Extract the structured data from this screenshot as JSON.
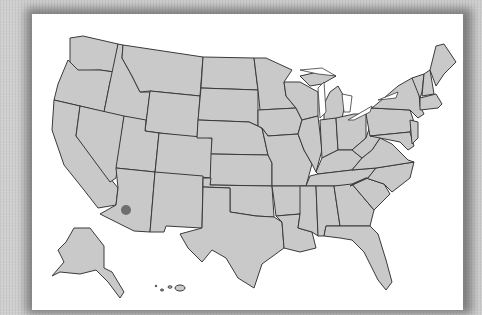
{
  "scene": {
    "description": "Photo of a printed outline map of the United States on white paper with a gray textured backdrop"
  },
  "map": {
    "title": "",
    "marker": {
      "label": "dot",
      "location": "southern Arizona",
      "color": "#6e6e6e"
    },
    "colors": {
      "state_fill": "#c9c9c9",
      "border": "#3a3a3a",
      "paper": "#ffffff",
      "background": "#cfcfcf"
    },
    "insets": [
      "Alaska",
      "Hawaii"
    ]
  }
}
